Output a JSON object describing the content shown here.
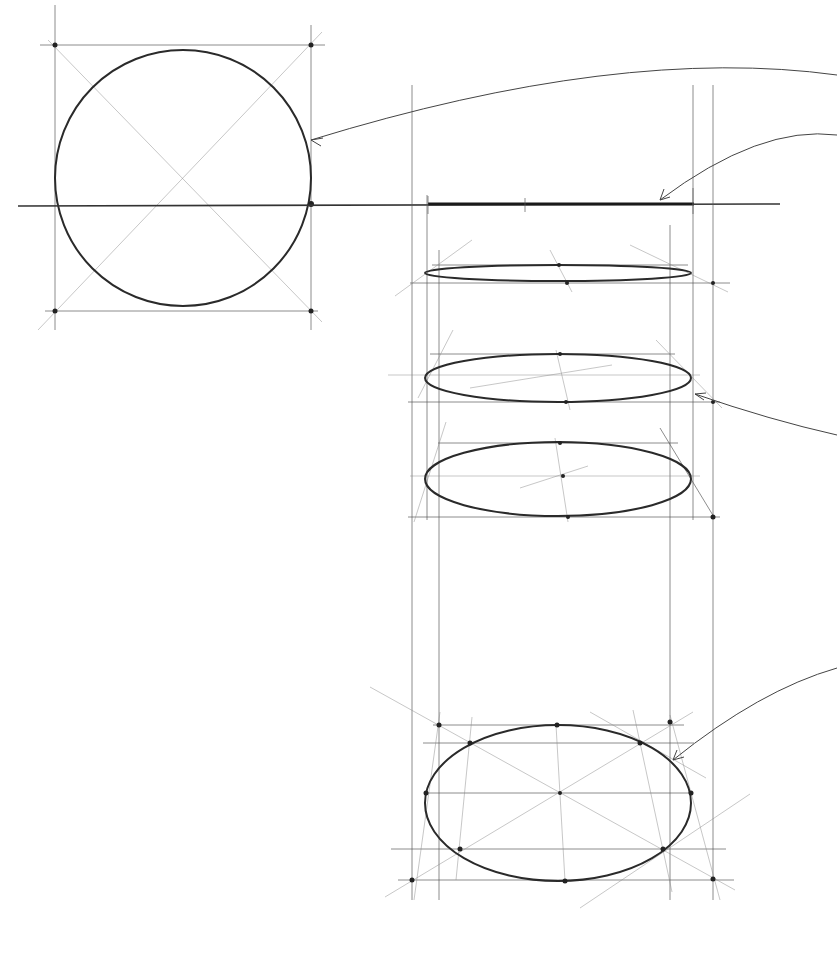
{
  "diagram": {
    "type": "perspective-ellipse-construction",
    "background": "#ffffff",
    "stroke_color": "#2a2a2a",
    "elements": [
      {
        "name": "reference-circle",
        "kind": "circle-in-square",
        "center": [
          183,
          178
        ],
        "radius": 128
      },
      {
        "name": "horizon-line",
        "kind": "line",
        "y": 205
      },
      {
        "name": "edge-on-line",
        "kind": "thick-segment",
        "x1": 428,
        "x2": 694,
        "y": 204
      },
      {
        "name": "ellipse-1",
        "kind": "ellipse",
        "cx": 558,
        "cy": 273,
        "rx": 133,
        "ry": 9
      },
      {
        "name": "ellipse-2",
        "kind": "ellipse",
        "cx": 558,
        "cy": 378,
        "rx": 133,
        "ry": 24
      },
      {
        "name": "ellipse-3",
        "kind": "ellipse",
        "cx": 558,
        "cy": 479,
        "rx": 133,
        "ry": 37
      },
      {
        "name": "ellipse-4",
        "kind": "ellipse",
        "cx": 558,
        "cy": 803,
        "rx": 133,
        "ry": 78
      }
    ],
    "leader_arrows": 5
  }
}
